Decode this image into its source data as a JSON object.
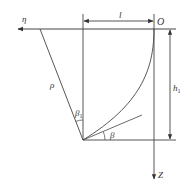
{
  "diagram": {
    "labels": {
      "eta": "η",
      "origin": "O",
      "length": "l",
      "height": "h",
      "height_sub": "1",
      "rho": "ρ",
      "beta": "β",
      "beta1": "β",
      "beta1_sub": "1",
      "z_axis": "Z"
    },
    "colors": {
      "line": "#333333",
      "background": "#ffffff"
    }
  }
}
